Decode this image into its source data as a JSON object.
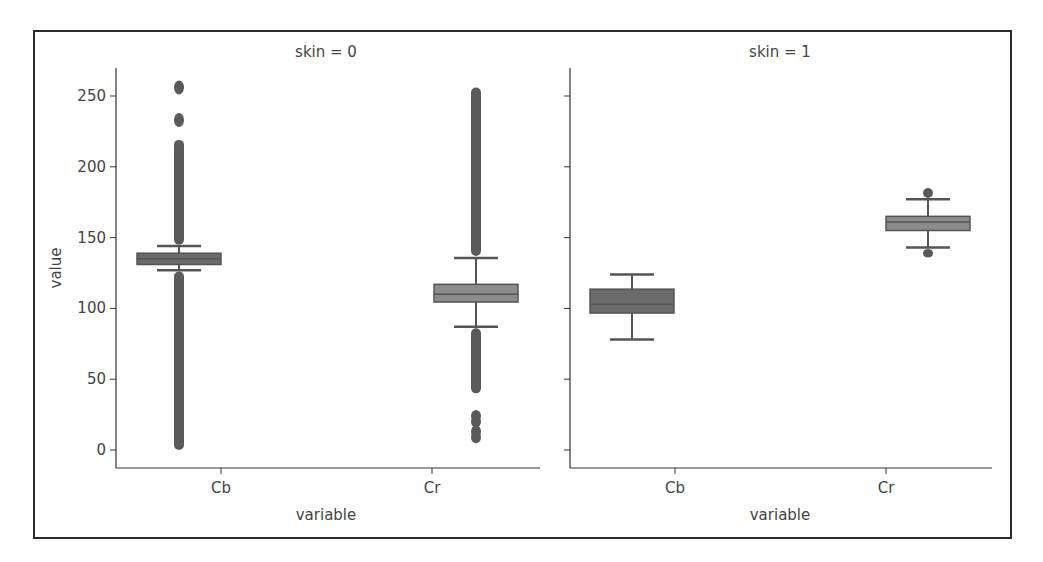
{
  "chart_data": {
    "type": "box",
    "ylabel": "value",
    "xlabel": "variable",
    "ylim": [
      -13,
      283
    ],
    "yticks": [
      0,
      50,
      100,
      150,
      200,
      250
    ],
    "categories": [
      "Cb",
      "Cr"
    ],
    "grid": false,
    "legend": null,
    "facets": [
      {
        "title": "skin = 0",
        "boxes": [
          {
            "category": "Cb",
            "whisker_low": 127,
            "q1": 131,
            "median": 135,
            "q3": 139,
            "whisker_high": 144,
            "outliers_range_low": [
              0,
              126
            ],
            "outliers_range_high": [
              145,
              219
            ],
            "outlier_points": [
              233,
              256
            ]
          },
          {
            "category": "Cr",
            "whisker_low": 87,
            "q1": 104.5,
            "median": 110,
            "q3": 117,
            "whisker_high": 135.6,
            "outliers_range_low": [
              40,
              86
            ],
            "outlier_points_low": [
              9,
              13,
              20,
              24
            ],
            "outliers_range_high": [
              137,
              256
            ]
          }
        ]
      },
      {
        "title": "skin = 1",
        "boxes": [
          {
            "category": "Cb",
            "whisker_low": 78,
            "q1": 96.7,
            "median": 103,
            "q3": 113.6,
            "whisker_high": 124,
            "outliers_range_low": [],
            "outliers_range_high": []
          },
          {
            "category": "Cr",
            "whisker_low": 143,
            "q1": 155,
            "median": 161,
            "q3": 165,
            "whisker_high": 177,
            "outliers_range_low": [
              136,
              142
            ],
            "outliers_range_high": [
              178,
              185
            ]
          }
        ]
      }
    ]
  },
  "panels": [
    {
      "title": "skin = 0",
      "xlabel": "variable",
      "ylabel": "value",
      "xticks": [
        "Cb",
        "Cr"
      ]
    },
    {
      "title": "skin = 1",
      "xlabel": "variable",
      "xticks": [
        "Cb",
        "Cr"
      ]
    }
  ],
  "yticks": [
    "0",
    "50",
    "100",
    "150",
    "200",
    "250"
  ],
  "colors": {
    "box_fill": "#6b6b6b",
    "box_fill_light": "#8c8c8c",
    "line": "#555555",
    "axis": "#333333",
    "border": "#2a2a2a"
  }
}
